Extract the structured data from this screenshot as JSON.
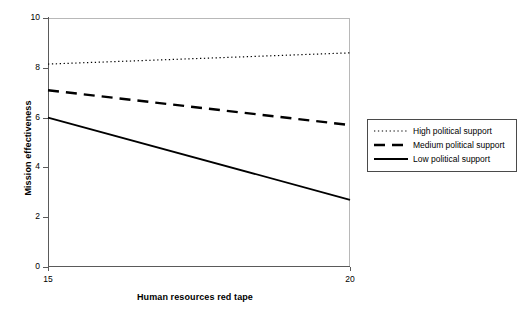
{
  "chart_data": {
    "type": "line",
    "title": "",
    "xlabel": "Human resources red tape",
    "ylabel": "Mission effectiveness",
    "xlim": [
      15,
      20
    ],
    "ylim": [
      0,
      10
    ],
    "xticks": [
      15,
      20
    ],
    "yticks": [
      0,
      2,
      4,
      6,
      8,
      10
    ],
    "xticklabels": [
      "15",
      "20"
    ],
    "yticklabels": [
      "0",
      "2",
      "4",
      "6",
      "8",
      "10"
    ],
    "grid": false,
    "legend_position": "right",
    "x": [
      15,
      20
    ],
    "series": [
      {
        "name": "High political support",
        "style": "dotted",
        "color": "#000000",
        "values": [
          8.15,
          8.6
        ]
      },
      {
        "name": "Medium political support",
        "style": "dashed",
        "color": "#000000",
        "values": [
          7.1,
          5.7
        ]
      },
      {
        "name": "Low political support",
        "style": "solid",
        "color": "#000000",
        "values": [
          6.0,
          2.7
        ]
      }
    ]
  },
  "legend": {
    "items": [
      {
        "label": "High political support"
      },
      {
        "label": "Medium political support"
      },
      {
        "label": "Low political support"
      }
    ]
  },
  "colors": {
    "axis": "#5a5a5a",
    "frame": "#b8b8b8",
    "line": "#000000",
    "background": "#ffffff"
  }
}
